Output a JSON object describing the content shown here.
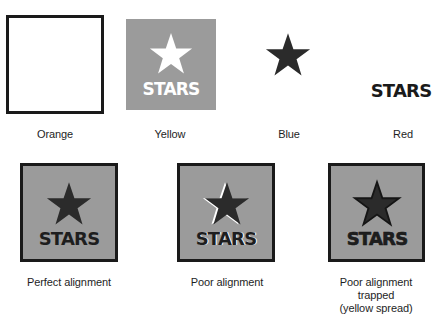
{
  "colors": {
    "background": "#ffffff",
    "ink": "#1e1e1e",
    "plate_fill": "#9b9b9b",
    "plate_border": "#1a1a1a",
    "knockout": "#ffffff",
    "star_dark": "#2b2b2b",
    "trap_edge": "#151515"
  },
  "separations": [
    {
      "label": "Orange",
      "icon": "square-outline-icon"
    },
    {
      "label": "Yellow",
      "icon": "star-knockout-icon",
      "text": "STARS"
    },
    {
      "label": "Blue",
      "icon": "star-icon"
    },
    {
      "label": "Red",
      "text": "STARS"
    }
  ],
  "composites": [
    {
      "label": "Perfect alignment",
      "text": "STARS"
    },
    {
      "label": "Poor alignment",
      "text": "STARS"
    },
    {
      "label_lines": [
        "Poor alignment",
        "trapped",
        "(yellow spread)"
      ],
      "text": "STARS"
    }
  ]
}
